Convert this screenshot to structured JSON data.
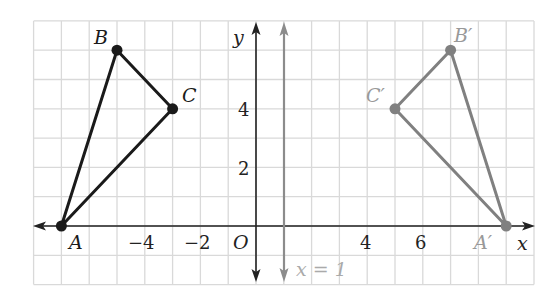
{
  "figure": {
    "grid": {
      "x_min": -8,
      "x_max": 10,
      "y_min": -2,
      "y_max": 7,
      "color": "#d9d9d9"
    },
    "axes": {
      "x_label": "x",
      "y_label": "y",
      "origin_label": "O",
      "x_ticks": [
        {
          "value": -4,
          "label": "−4"
        },
        {
          "value": -2,
          "label": "−2"
        },
        {
          "value": 4,
          "label": "4"
        },
        {
          "value": 6,
          "label": "6"
        }
      ],
      "y_ticks": [
        {
          "value": 2,
          "label": "2"
        },
        {
          "value": 4,
          "label": "4"
        }
      ]
    },
    "reflection_line": {
      "equation": "x = 1",
      "x": 1,
      "color": "#8c8c8c"
    },
    "original_triangle": {
      "color": "#1a1a1a",
      "points": [
        {
          "name": "A",
          "x": -7,
          "y": 0
        },
        {
          "name": "B",
          "x": -5,
          "y": 6
        },
        {
          "name": "C",
          "x": -3,
          "y": 4
        }
      ]
    },
    "image_triangle": {
      "color": "#808080",
      "points": [
        {
          "name": "A′",
          "x": 9,
          "y": 0
        },
        {
          "name": "B′",
          "x": 7,
          "y": 6
        },
        {
          "name": "C′",
          "x": 5,
          "y": 4
        }
      ]
    }
  }
}
